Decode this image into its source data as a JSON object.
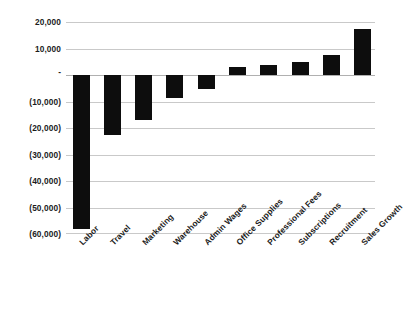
{
  "chart_data": {
    "type": "bar",
    "title": "",
    "subtitle": "",
    "xlabel": "",
    "ylabel": "",
    "categories": [
      "Labor",
      "Travel",
      "Marketing",
      "Warehouse",
      "Admin Wages",
      "Office Supplies",
      "Professional Fees",
      "Subscriptions",
      "Recruitment",
      "Sales Growth"
    ],
    "values": [
      -58000,
      -22500,
      -17000,
      -8800,
      -5200,
      3000,
      3600,
      4800,
      7400,
      17500
    ],
    "ylim": [
      -60000,
      20000
    ],
    "ytick_values": [
      20000,
      10000,
      0,
      -10000,
      -20000,
      -30000,
      -40000,
      -50000,
      -60000
    ],
    "ytick_labels": [
      "20,000",
      "10,000",
      "-",
      "(10,000)",
      "(20,000)",
      "(30,000)",
      "(40,000)",
      "(50,000)",
      "(60,000)"
    ],
    "grid": true,
    "legend": false,
    "legend_position": "none",
    "bar_color": "#0d0d0d",
    "gridline_color": "#c9c9c9",
    "background_color": "#ffffff",
    "xtick_rotation": -45
  }
}
